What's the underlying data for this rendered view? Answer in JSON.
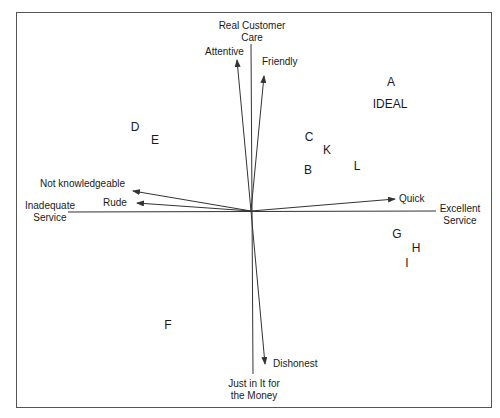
{
  "axes": {
    "top": {
      "line1": "Real Customer",
      "line2": "Care"
    },
    "bottom": {
      "line1": "Just in It for",
      "line2": "the Money"
    },
    "left": {
      "line1": "Inadequate",
      "line2": "Service"
    },
    "right": {
      "line1": "Excellent",
      "line2": "Service"
    }
  },
  "vectors": [
    {
      "label": "Attentive"
    },
    {
      "label": "Friendly"
    },
    {
      "label": "Not knowledgeable"
    },
    {
      "label": "Rude"
    },
    {
      "label": "Quick"
    },
    {
      "label": "Dishonest"
    }
  ],
  "points": [
    {
      "label": "A"
    },
    {
      "label": "IDEAL"
    },
    {
      "label": "B"
    },
    {
      "label": "C"
    },
    {
      "label": "D"
    },
    {
      "label": "E"
    },
    {
      "label": "F"
    },
    {
      "label": "G"
    },
    {
      "label": "H"
    },
    {
      "label": "I"
    },
    {
      "label": "K"
    },
    {
      "label": "L"
    }
  ],
  "colors": {
    "line": "#333333",
    "text": "#1a1a1a",
    "border": "#555555"
  }
}
